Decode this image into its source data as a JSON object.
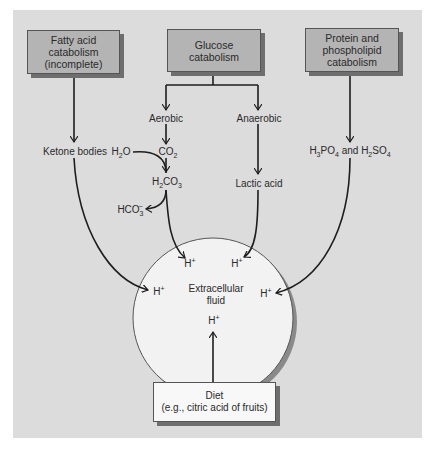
{
  "diagram": {
    "type": "flow",
    "sources": {
      "fatty_acid": {
        "line1": "Fatty acid",
        "line2": "catabolism",
        "line3": "(incomplete)"
      },
      "glucose": {
        "line1": "Glucose",
        "line2": "catabolism"
      },
      "protein": {
        "line1": "Protein and",
        "line2": "phospholipid",
        "line3": "catabolism"
      },
      "diet": {
        "line1": "Diet",
        "line2": "(e.g., citric acid of fruits)"
      }
    },
    "intermediates": {
      "aerobic": "Aerobic",
      "anaerobic": "Anaerobic",
      "ketone_bodies": "Ketone bodies",
      "h2o": {
        "base": "H",
        "sub": "2",
        "rest": "O"
      },
      "co2": {
        "base": "CO",
        "sub": "2"
      },
      "h2co3": {
        "h": "H",
        "sub1": "2",
        "co": "CO",
        "sub2": "3"
      },
      "hco3": {
        "base": "HCO",
        "sub": "3",
        "sup": "−"
      },
      "lactic_acid": "Lactic acid",
      "h3po4_h2so4": {
        "h1": "H",
        "s1": "3",
        "po": "PO",
        "s2": "4",
        "and": " and ",
        "h2": "H",
        "s3": "2",
        "so": "SO",
        "s4": "4"
      }
    },
    "target": {
      "label_line1": "Extracellular",
      "label_line2": "fluid",
      "proton": {
        "base": "H",
        "sup": "+"
      }
    },
    "colors": {
      "panel": "#dcdcdc",
      "source_box": "#b4b4b4",
      "diet_box": "#f8f8f8",
      "circle": "#f2f2f2",
      "arrows": "#1e1e1e"
    }
  }
}
